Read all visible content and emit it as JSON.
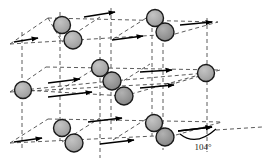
{
  "figure": {
    "name": "crystal-lattice-unit-cell-diagram",
    "background_color": "#ffffff",
    "width": 263,
    "height": 164,
    "annotation_label": "104°"
  },
  "style": {
    "atom_fill": "#a8a8a8",
    "atom_fill_dark": "#8f8f8f",
    "atom_stroke": "#1a1a1a",
    "atom_radius": 8.5,
    "lattice_line_color": "#4a4a4a",
    "lattice_dash": "4,3",
    "arrow_color": "#000000",
    "text_color": "#1a1a1a"
  },
  "lattice": {
    "vertical_lines": [
      {
        "x": 22,
        "y1": 32,
        "y2": 150
      },
      {
        "x": 60,
        "y1": 12,
        "y2": 140
      },
      {
        "x": 100,
        "y1": 36,
        "y2": 158
      },
      {
        "x": 111,
        "y1": 8,
        "y2": 130
      },
      {
        "x": 152,
        "y1": 14,
        "y2": 136
      },
      {
        "x": 163,
        "y1": 22,
        "y2": 150
      },
      {
        "x": 207,
        "y1": 18,
        "y2": 152
      }
    ],
    "layers": [
      {
        "name": "top-layer",
        "front_left": {
          "x": 22,
          "y": 44
        },
        "front_right": {
          "x": 163,
          "y": 36
        },
        "back_left": {
          "x": 60,
          "y": 18
        },
        "back_right": {
          "x": 207,
          "y": 24
        }
      },
      {
        "name": "middle-layer",
        "front_left": {
          "x": 22,
          "y": 92
        },
        "front_right": {
          "x": 163,
          "y": 84
        },
        "back_left": {
          "x": 60,
          "y": 66
        },
        "back_right": {
          "x": 207,
          "y": 72
        }
      },
      {
        "name": "bottom-layer",
        "front_left": {
          "x": 22,
          "y": 144
        },
        "front_right": {
          "x": 163,
          "y": 136
        },
        "back_left": {
          "x": 60,
          "y": 118
        },
        "back_right": {
          "x": 207,
          "y": 124
        }
      }
    ]
  },
  "atoms": [
    {
      "id": "atom-top-back-left",
      "x": 62,
      "y": 25,
      "r": 8.5,
      "shade": "light"
    },
    {
      "id": "atom-top-front-left",
      "x": 73,
      "y": 40,
      "r": 9.0,
      "shade": "light"
    },
    {
      "id": "atom-top-back-right",
      "x": 155,
      "y": 18,
      "r": 8.5,
      "shade": "light"
    },
    {
      "id": "atom-top-front-right",
      "x": 165,
      "y": 32,
      "r": 9.0,
      "shade": "dark"
    },
    {
      "id": "atom-mid-center-back",
      "x": 100,
      "y": 68,
      "r": 8.5,
      "shade": "light"
    },
    {
      "id": "atom-mid-center",
      "x": 112,
      "y": 81,
      "r": 9.0,
      "shade": "dark"
    },
    {
      "id": "atom-mid-center-front",
      "x": 124,
      "y": 96,
      "r": 9.0,
      "shade": "dark"
    },
    {
      "id": "atom-mid-left",
      "x": 23,
      "y": 90,
      "r": 8.5,
      "shade": "light"
    },
    {
      "id": "atom-mid-right",
      "x": 206,
      "y": 73,
      "r": 8.5,
      "shade": "light"
    },
    {
      "id": "atom-bot-back-left",
      "x": 62,
      "y": 128,
      "r": 8.5,
      "shade": "light"
    },
    {
      "id": "atom-bot-front-left",
      "x": 74,
      "y": 143,
      "r": 9.0,
      "shade": "light"
    },
    {
      "id": "atom-bot-back-right",
      "x": 154,
      "y": 123,
      "r": 8.5,
      "shade": "light"
    },
    {
      "id": "atom-bot-front-right",
      "x": 165,
      "y": 137,
      "r": 9.0,
      "shade": "dark"
    }
  ],
  "arrows": [
    {
      "id": "arrow-top-left-outer",
      "x1": 14,
      "y1": 42,
      "x2": 38,
      "y2": 38
    },
    {
      "id": "arrow-top-back-upper",
      "x1": 84,
      "y1": 17,
      "x2": 115,
      "y2": 12
    },
    {
      "id": "arrow-top-front-mid",
      "x1": 112,
      "y1": 40,
      "x2": 143,
      "y2": 36
    },
    {
      "id": "arrow-top-right-outer",
      "x1": 180,
      "y1": 25,
      "x2": 212,
      "y2": 22
    },
    {
      "id": "arrow-mid-back-left",
      "x1": 48,
      "y1": 83,
      "x2": 80,
      "y2": 79
    },
    {
      "id": "arrow-mid-front-left",
      "x1": 48,
      "y1": 97,
      "x2": 92,
      "y2": 92
    },
    {
      "id": "arrow-mid-back-right",
      "x1": 140,
      "y1": 72,
      "x2": 172,
      "y2": 70
    },
    {
      "id": "arrow-mid-front-right",
      "x1": 140,
      "y1": 88,
      "x2": 174,
      "y2": 85
    },
    {
      "id": "arrow-bot-left-outer",
      "x1": 14,
      "y1": 142,
      "x2": 42,
      "y2": 138
    },
    {
      "id": "arrow-bot-back",
      "x1": 88,
      "y1": 122,
      "x2": 122,
      "y2": 118
    },
    {
      "id": "arrow-bot-front",
      "x1": 100,
      "y1": 144,
      "x2": 134,
      "y2": 140
    },
    {
      "id": "arrow-bot-right",
      "x1": 178,
      "y1": 131,
      "x2": 212,
      "y2": 127
    }
  ],
  "angle_marker": {
    "id": "angle-arc-104",
    "label": "104°",
    "label_x": 203,
    "label_y": 148,
    "arc_path": "M 180 134 Q 196 146 216 130"
  }
}
